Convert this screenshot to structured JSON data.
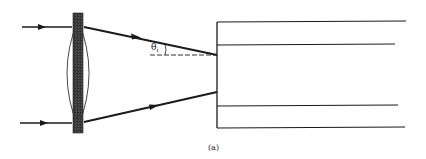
{
  "diagram": {
    "caption": "(a)",
    "angle_label": {
      "symbol": "θ",
      "subscript": "i"
    },
    "colors": {
      "line": "#1a1a1a",
      "lens_fill": "#3a3a3a",
      "background": "#ffffff"
    },
    "elements": {
      "lens": "converging lens",
      "incoming_rays": 2,
      "refracted_rays": 2,
      "waveguide": "fiber/waveguide with core and cladding"
    }
  }
}
